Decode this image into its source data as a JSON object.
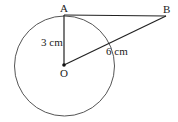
{
  "diagram": {
    "points": {
      "A": {
        "label": "A",
        "x": 64,
        "y": 15
      },
      "B": {
        "label": "B",
        "x": 166,
        "y": 16
      },
      "O": {
        "label": "O",
        "x": 64,
        "y": 65
      }
    },
    "circle": {
      "cx": 64.5,
      "cy": 66,
      "r": 50,
      "stroke": "#555555"
    },
    "segments": [
      {
        "from": "A",
        "to": "B"
      },
      {
        "from": "A",
        "to": "O",
        "label": "3 cm"
      },
      {
        "from": "O",
        "to": "B",
        "label": "6 cm"
      }
    ],
    "labels": {
      "A": "A",
      "B": "B",
      "O": "O",
      "OA_length": "3 cm",
      "OB_length": "6 cm"
    },
    "line_color": "#222222"
  }
}
